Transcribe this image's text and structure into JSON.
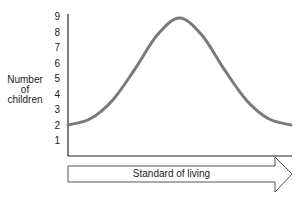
{
  "chart_data": {
    "type": "line",
    "title": "",
    "xlabel": "Standard of living",
    "ylabel": "Number of children",
    "ylabel_lines": [
      "Number",
      "of",
      "children"
    ],
    "yticks": [
      1,
      2,
      3,
      4,
      5,
      6,
      7,
      8,
      9
    ],
    "ylim": [
      0,
      9
    ],
    "xticks": [],
    "grid": false,
    "legend": null,
    "series": [
      {
        "name": "Number of children",
        "color": "#7a7a7a",
        "x": [
          0,
          0.1,
          0.2,
          0.3,
          0.4,
          0.5,
          0.6,
          0.7,
          0.8,
          0.9,
          1.0
        ],
        "values": [
          2.0,
          2.4,
          3.6,
          5.6,
          7.8,
          8.9,
          7.8,
          5.6,
          3.6,
          2.4,
          2.0
        ]
      }
    ],
    "x_axis_style": "arrow"
  }
}
